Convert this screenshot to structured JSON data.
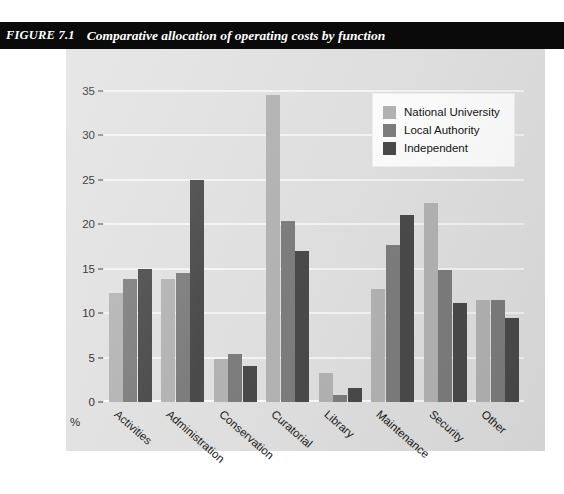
{
  "caption": {
    "figure_number": "FIGURE 7.1",
    "title": "Comparative allocation of operating costs by function"
  },
  "legend": {
    "position": "inside-top-right",
    "entries": [
      {
        "label": "National University",
        "color": "#b3b3b3"
      },
      {
        "label": "Local Authority",
        "color": "#7d7d7d"
      },
      {
        "label": "Independent",
        "color": "#4a4a4a"
      }
    ]
  },
  "axes": {
    "y_unit_label": "%",
    "y_ticks": [
      "0",
      "5",
      "10",
      "15",
      "20",
      "25",
      "30",
      "35"
    ]
  },
  "chart_data": {
    "type": "bar",
    "title": "Comparative allocation of operating costs by function",
    "xlabel": "",
    "ylabel": "%",
    "ylim": [
      0,
      35
    ],
    "yticks": [
      0,
      5,
      10,
      15,
      20,
      25,
      30,
      35
    ],
    "grid": true,
    "legend_position": "inside-top-right",
    "grouping": "grouped",
    "categories": [
      "Activities",
      "Administration",
      "Conservation",
      "Curatorial",
      "Library",
      "Maintenance",
      "Security",
      "Other"
    ],
    "series": [
      {
        "name": "National University",
        "color": "#b3b3b3",
        "values": [
          12.3,
          13.8,
          4.8,
          34.5,
          3.3,
          12.7,
          22.4,
          11.5
        ]
      },
      {
        "name": "Local Authority",
        "color": "#7d7d7d",
        "values": [
          13.9,
          14.5,
          5.4,
          20.4,
          0.8,
          17.7,
          14.9,
          11.5
        ]
      },
      {
        "name": "Independent",
        "color": "#4a4a4a",
        "values": [
          15.0,
          25.0,
          4.1,
          17.0,
          1.6,
          21.0,
          11.1,
          9.4
        ]
      }
    ]
  }
}
